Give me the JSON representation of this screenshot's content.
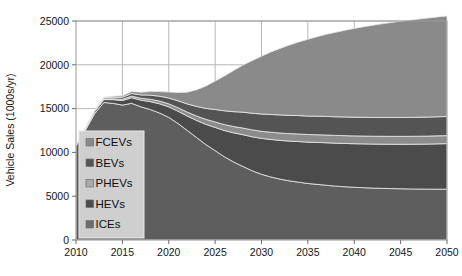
{
  "chart_data": {
    "type": "area",
    "stacked": true,
    "title": "",
    "xlabel": "",
    "ylabel": "Vehicle Sales (1000s/yr)",
    "xlim": [
      2010,
      2050
    ],
    "ylim": [
      0,
      25000
    ],
    "xticks": [
      "2010",
      "2015",
      "2020",
      "2025",
      "2030",
      "2035",
      "2040",
      "2045",
      "2050"
    ],
    "yticks": [
      "0",
      "5000",
      "10000",
      "15000",
      "20000",
      "25000"
    ],
    "grid": true,
    "legend_position": "inside-lower-left",
    "x": [
      2010,
      2011,
      2012,
      2013,
      2014,
      2015,
      2016,
      2017,
      2018,
      2019,
      2020,
      2021,
      2022,
      2023,
      2024,
      2025,
      2026,
      2027,
      2028,
      2029,
      2030,
      2031,
      2032,
      2033,
      2034,
      2035,
      2036,
      2037,
      2038,
      2039,
      2040,
      2041,
      2042,
      2043,
      2044,
      2045,
      2046,
      2047,
      2048,
      2049,
      2050
    ],
    "series": [
      {
        "name": "ICEs",
        "color": "#5e5e5e",
        "values": [
          10700,
          12500,
          14400,
          15700,
          15600,
          15400,
          15600,
          15200,
          14900,
          14500,
          14000,
          13300,
          12500,
          11700,
          10900,
          10200,
          9500,
          8900,
          8400,
          7900,
          7500,
          7200,
          6950,
          6750,
          6600,
          6450,
          6350,
          6250,
          6150,
          6080,
          6020,
          5970,
          5930,
          5900,
          5870,
          5850,
          5830,
          5820,
          5810,
          5805,
          5800
        ]
      },
      {
        "name": "HEVs",
        "color": "#4b4b4b",
        "values": [
          100,
          160,
          240,
          330,
          420,
          520,
          640,
          760,
          900,
          1050,
          1200,
          1400,
          1650,
          1950,
          2300,
          2650,
          3000,
          3330,
          3620,
          3880,
          4100,
          4280,
          4420,
          4540,
          4640,
          4720,
          4790,
          4850,
          4900,
          4940,
          4970,
          5000,
          5020,
          5040,
          5060,
          5080,
          5100,
          5120,
          5140,
          5170,
          5200
        ]
      },
      {
        "name": "PHEVs",
        "color": "#8c8c8c",
        "values": [
          20,
          35,
          55,
          80,
          110,
          145,
          185,
          225,
          270,
          310,
          350,
          400,
          450,
          510,
          570,
          630,
          680,
          720,
          760,
          790,
          810,
          830,
          845,
          855,
          865,
          870,
          878,
          884,
          888,
          892,
          895,
          898,
          900,
          902,
          904,
          906,
          908,
          910,
          912,
          914,
          916
        ]
      },
      {
        "name": "BEVs",
        "color": "#545454",
        "values": [
          30,
          50,
          80,
          120,
          170,
          230,
          300,
          380,
          470,
          560,
          660,
          790,
          930,
          1090,
          1250,
          1420,
          1570,
          1700,
          1810,
          1900,
          1970,
          2020,
          2060,
          2085,
          2100,
          2110,
          2118,
          2124,
          2128,
          2132,
          2136,
          2140,
          2144,
          2148,
          2152,
          2156,
          2160,
          2166,
          2172,
          2178,
          2184
        ]
      },
      {
        "name": "FCEVs",
        "color": "#8a8a8a",
        "values": [
          10,
          20,
          40,
          70,
          110,
          160,
          220,
          300,
          400,
          520,
          680,
          950,
          1350,
          1900,
          2550,
          3250,
          3980,
          4700,
          5380,
          6010,
          6600,
          7130,
          7600,
          8020,
          8400,
          8760,
          9080,
          9380,
          9650,
          9900,
          10130,
          10330,
          10520,
          10690,
          10840,
          10980,
          11100,
          11210,
          11310,
          11400,
          11480
        ]
      }
    ],
    "total_at_2050": 23580,
    "legend_entries": [
      {
        "label": "FCEVs",
        "swatch": "#8a8a8a"
      },
      {
        "label": "BEVs",
        "swatch": "#545454"
      },
      {
        "label": "PHEVs",
        "swatch": "#aaaaaa"
      },
      {
        "label": "HEVs",
        "swatch": "#4b4b4b"
      },
      {
        "label": "ICEs",
        "swatch": "#6d6d6d"
      }
    ]
  },
  "axes": {
    "y_title": "Vehicle Sales (1000s/yr)",
    "x_title": ""
  }
}
